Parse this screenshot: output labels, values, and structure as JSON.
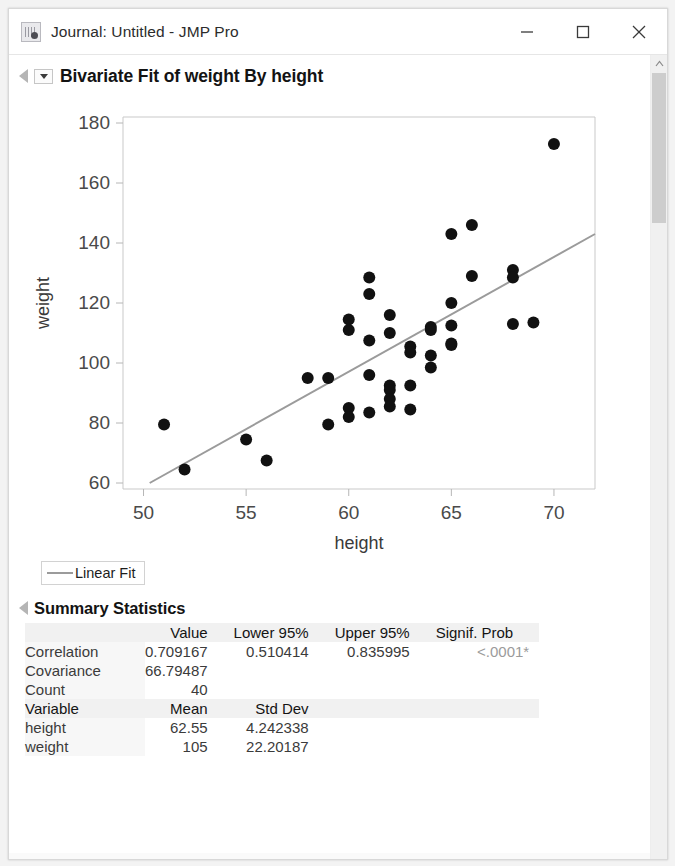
{
  "window": {
    "title": "Journal: Untitled - JMP Pro",
    "app_icon": "jmp-journal-icon",
    "controls": {
      "minimize": "minimize-icon",
      "maximize": "maximize-icon",
      "close": "close-icon"
    }
  },
  "scrollbar": {
    "up_arrow": "chevron-up-icon"
  },
  "report": {
    "title": "Bivariate Fit of weight By height",
    "legend_label": "Linear Fit",
    "summary_title": "Summary Statistics"
  },
  "summary": {
    "headers": [
      "",
      "Value",
      "Lower 95%",
      "Upper 95%",
      "Signif. Prob"
    ],
    "rows": [
      {
        "label": "Correlation",
        "value": "0.709167",
        "lower": "0.510414",
        "upper": "0.835995",
        "prob": "<.0001*"
      },
      {
        "label": "Covariance",
        "value": "66.79487",
        "lower": "",
        "upper": "",
        "prob": ""
      },
      {
        "label": "Count",
        "value": "40",
        "lower": "",
        "upper": "",
        "prob": ""
      }
    ],
    "variable_headers": [
      "Variable",
      "Mean",
      "Std Dev"
    ],
    "variables": [
      {
        "name": "height",
        "mean": "62.55",
        "sd": "4.242338"
      },
      {
        "name": "weight",
        "mean": "105",
        "sd": "22.20187"
      }
    ]
  },
  "chart_data": {
    "type": "scatter",
    "title": "Bivariate Fit of weight By height",
    "xlabel": "height",
    "ylabel": "weight",
    "xlim": [
      49.0,
      72.0
    ],
    "ylim": [
      58.0,
      182.0
    ],
    "xticks": [
      50,
      55,
      60,
      65,
      70
    ],
    "yticks": [
      60,
      80,
      100,
      120,
      140,
      160,
      180
    ],
    "grid": false,
    "point_color": "#111111",
    "point_size": 6,
    "legend": [
      "Linear Fit"
    ],
    "legend_position": "below-plot",
    "points": [
      [
        51,
        79.5
      ],
      [
        52,
        64.5
      ],
      [
        55,
        74.5
      ],
      [
        56,
        67.5
      ],
      [
        58,
        95.0
      ],
      [
        59,
        95.0
      ],
      [
        59,
        79.5
      ],
      [
        60,
        114.5
      ],
      [
        60,
        111.0
      ],
      [
        60,
        85.0
      ],
      [
        60,
        82.0
      ],
      [
        61,
        128.5
      ],
      [
        61,
        123.0
      ],
      [
        61,
        107.5
      ],
      [
        61,
        96.0
      ],
      [
        61,
        83.5
      ],
      [
        62,
        116.0
      ],
      [
        62,
        110.0
      ],
      [
        62,
        92.5
      ],
      [
        62,
        91.0
      ],
      [
        62,
        88.0
      ],
      [
        62,
        85.5
      ],
      [
        63,
        105.5
      ],
      [
        63,
        103.5
      ],
      [
        63,
        92.5
      ],
      [
        63,
        84.5
      ],
      [
        64,
        112.0
      ],
      [
        64,
        111.0
      ],
      [
        64,
        102.5
      ],
      [
        64,
        98.5
      ],
      [
        65,
        143.0
      ],
      [
        65,
        120.0
      ],
      [
        65,
        112.5
      ],
      [
        65,
        106.5
      ],
      [
        65,
        106.0
      ],
      [
        66,
        146.0
      ],
      [
        66,
        129.0
      ],
      [
        68,
        131.0
      ],
      [
        68,
        128.5
      ],
      [
        68,
        113.0
      ],
      [
        69,
        113.5
      ],
      [
        70,
        173.0
      ]
    ],
    "fit_line": {
      "x": [
        50.3,
        72.0
      ],
      "y": [
        60.0,
        143.0
      ],
      "color": "#9b9b9b",
      "width": 2
    }
  }
}
